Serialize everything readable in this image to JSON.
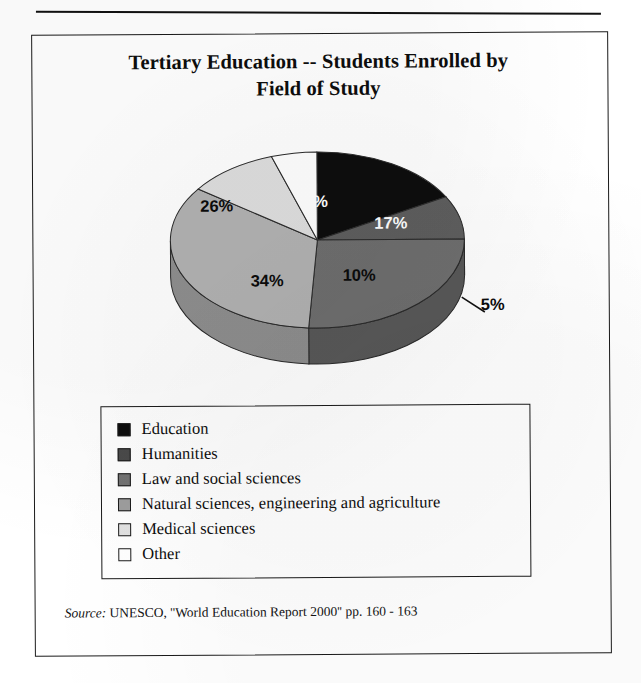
{
  "document": {
    "title_line1": "Tertiary Education -- Students Enrolled by",
    "title_line2": "Field of Study",
    "source_keyword": "Source:",
    "source_text": " UNESCO, ''World Education Report 2000'' pp. 160 - 163"
  },
  "chart_data": {
    "type": "pie",
    "title": "Tertiary Education -- Students Enrolled by Field of Study",
    "subtitle": "",
    "xlabel": "",
    "ylabel": "",
    "three_d": true,
    "legend_position": "bottom",
    "grid": false,
    "units": "percent",
    "categories": [
      "Education",
      "Humanities",
      "Law and social sciences",
      "Natural sciences, engineering and agriculture",
      "Medical sciences",
      "Other"
    ],
    "values": [
      17,
      8,
      26,
      34,
      10,
      5
    ],
    "labels": [
      "17%",
      "8%",
      "26%",
      "34%",
      "10%",
      "5%"
    ],
    "colors": [
      "#0d0d0d",
      "#5e5e5e",
      "#6e6e6e",
      "#b2b2b2",
      "#dedede",
      "#ffffff"
    ],
    "slices": [
      {
        "name": "Education",
        "value": 17,
        "label": "17%",
        "color": "#0d0d0d",
        "label_color": "#ffffff"
      },
      {
        "name": "Humanities",
        "value": 8,
        "label": "8%",
        "color": "#5e5e5e",
        "label_color": "#ffffff"
      },
      {
        "name": "Law and social sciences",
        "value": 26,
        "label": "26%",
        "color": "#6e6e6e",
        "label_color": "#0b0b0b"
      },
      {
        "name": "Natural sciences, engineering and agriculture",
        "value": 34,
        "label": "34%",
        "color": "#b2b2b2",
        "label_color": "#0b0b0b"
      },
      {
        "name": "Medical sciences",
        "value": 10,
        "label": "10%",
        "color": "#dedede",
        "label_color": "#0b0b0b"
      },
      {
        "name": "Other",
        "value": 5,
        "label": "5%",
        "color": "#ffffff",
        "label_color": "#0b0b0b"
      }
    ],
    "total": 100,
    "source": "UNESCO, ''World Education Report 2000'' pp. 160 - 163"
  },
  "slice_labels": {
    "education": "17%",
    "humanities": "8%",
    "law": "26%",
    "natural": "34%",
    "medical": "10%",
    "other": "5%"
  },
  "legend": {
    "items": [
      {
        "label": "Education",
        "color": "#0d0d0d"
      },
      {
        "label": "Humanities",
        "color": "#4a4a4a"
      },
      {
        "label": "Law and social sciences",
        "color": "#737373"
      },
      {
        "label": "Natural sciences, engineering and agriculture",
        "color": "#9e9e9e"
      },
      {
        "label": "Medical sciences",
        "color": "#e2e2e2"
      },
      {
        "label": "Other",
        "color": "#ffffff"
      }
    ]
  }
}
